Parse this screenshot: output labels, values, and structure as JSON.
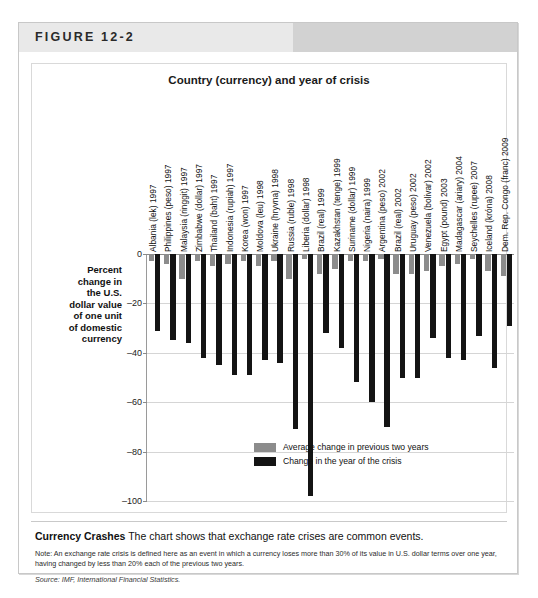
{
  "figure": {
    "number_label": "FIGURE 12-2"
  },
  "chart_data": {
    "type": "bar",
    "title": "Country (currency) and year of crisis",
    "xlabel": "Country (currency) and year of crisis",
    "ylabel": "Percent change in the U.S. dollar value of one unit of domestic currency",
    "ylim": [
      -100,
      0
    ],
    "yticks": [
      0,
      -20,
      -40,
      -60,
      -80,
      -100
    ],
    "ytick_labels": [
      "0",
      "–20",
      "–40",
      "–60",
      "–80",
      "–100"
    ],
    "grid": true,
    "legend_position": "inside-bottom-right",
    "categories": [
      "Albania (lek) 1997",
      "Philippines (peso) 1997",
      "Malaysia (ringgit) 1997",
      "Zimbabwe (dollar) 1997",
      "Thailand (baht) 1997",
      "Indonesia (rupiah) 1997",
      "Korea (won) 1997",
      "Moldova (leu) 1998",
      "Ukraine (hryvna) 1998",
      "Russia (ruble) 1998",
      "Liberia (dollar) 1998",
      "Brazil (real) 1999",
      "Kazakhstan (tenge) 1999",
      "Suriname (dollar) 1999",
      "Nigeria (naira) 1999",
      "Argentina (peso) 2002",
      "Brazil (real) 2002",
      "Uruguay (peso) 2002",
      "Venezuela (bolivar) 2002",
      "Egypt (pound) 2003",
      "Madagascar (ariary) 2004",
      "Seychelles (rupee) 2007",
      "Iceland (króna) 2008",
      "Dem. Rep. Congo (franc) 2009"
    ],
    "series": [
      {
        "name": "Average change in previous two years",
        "color": "#8c8c8c",
        "values": [
          -3,
          -4,
          -10,
          -3,
          -5,
          -4,
          -3,
          -5,
          -3,
          -10,
          -2,
          -8,
          -6,
          -3,
          -3,
          -2,
          -8,
          -8,
          -7,
          -5,
          -4,
          -2,
          -7,
          -9
        ]
      },
      {
        "name": "Change in the year of the crisis",
        "color": "#141414",
        "values": [
          -31,
          -35,
          -36,
          -42,
          -45,
          -49,
          -49,
          -43,
          -44,
          -71,
          -98,
          -32,
          -38,
          -52,
          -60,
          -70,
          -50,
          -50,
          -34,
          -42,
          -43,
          -33,
          -46,
          -29
        ]
      }
    ]
  },
  "legend": {
    "items": [
      {
        "label": "Average change in previous two years",
        "swatch": "prev"
      },
      {
        "label": "Change in the year of the crisis",
        "swatch": "crisis"
      }
    ]
  },
  "caption": {
    "bold_lead": "Currency Crashes",
    "headline": "The chart shows that exchange rate crises are common events.",
    "note": "Note: An exchange rate crisis is defined here as an event in which a currency loses more than 30% of its value in U.S. dollar terms over one year, having changed by less than 20% each of the previous two years.",
    "source": "Source: IMF, International Financial Statistics."
  }
}
